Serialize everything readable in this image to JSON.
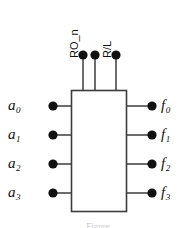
{
  "figure": {
    "background_color": "#ffffff",
    "stroke_color": "#3c3c3c",
    "dot_color": "#111111",
    "label_color": "#111111",
    "box": {
      "x": 71,
      "y": 90,
      "width": 55,
      "height": 121
    },
    "top_pins": [
      {
        "id": "ro_n",
        "label": "RO_n",
        "dot_x": 83,
        "dot_y": 55,
        "label_x": 80,
        "label_y": 47
      },
      {
        "id": "ro_n_b",
        "label": "",
        "dot_x": 95,
        "dot_y": 55,
        "label_x": 0,
        "label_y": 0
      },
      {
        "id": "r_l",
        "label": "R/L",
        "dot_x": 116,
        "dot_y": 55,
        "label_x": 113,
        "label_y": 47
      }
    ],
    "inputs": [
      {
        "id": "a0",
        "base": "a",
        "sub": "0",
        "dot_x": 53,
        "dot_y": 106,
        "label_x": 8,
        "label_y": 98
      },
      {
        "id": "a1",
        "base": "a",
        "sub": "1",
        "dot_x": 53,
        "dot_y": 135,
        "label_x": 8,
        "label_y": 127
      },
      {
        "id": "a2",
        "base": "a",
        "sub": "2",
        "dot_x": 53,
        "dot_y": 164,
        "label_x": 8,
        "label_y": 156
      },
      {
        "id": "a3",
        "base": "a",
        "sub": "3",
        "dot_x": 53,
        "dot_y": 193,
        "label_x": 8,
        "label_y": 185
      }
    ],
    "outputs": [
      {
        "id": "f0",
        "base": "f",
        "sub": "0",
        "dot_x": 152,
        "dot_y": 106,
        "label_x": 161,
        "label_y": 98
      },
      {
        "id": "f1",
        "base": "f",
        "sub": "1",
        "dot_x": 152,
        "dot_y": 135,
        "label_x": 161,
        "label_y": 127
      },
      {
        "id": "f2",
        "base": "f",
        "sub": "2",
        "dot_x": 152,
        "dot_y": 164,
        "label_x": 161,
        "label_y": 156
      },
      {
        "id": "f3",
        "base": "f",
        "sub": "3",
        "dot_x": 152,
        "dot_y": 193,
        "label_x": 161,
        "label_y": 185
      }
    ],
    "caption_fragment": "Figure",
    "caption_y": 222
  }
}
